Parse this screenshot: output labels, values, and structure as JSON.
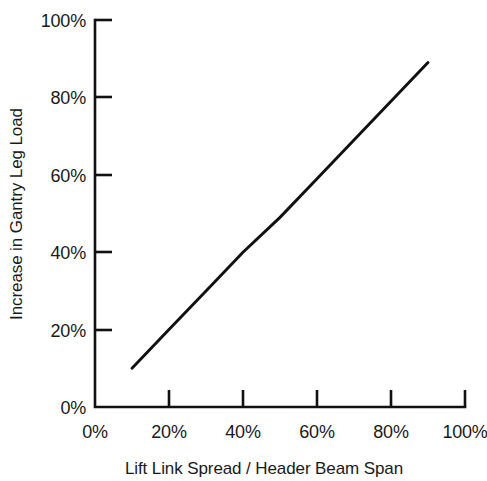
{
  "chart_data": {
    "type": "line",
    "title": "",
    "subtitle": "",
    "xlabel": "Lift Link Spread / Header Beam Span",
    "ylabel": "Increase in Gantry Leg Load",
    "xlim": [
      0,
      100
    ],
    "ylim": [
      0,
      100
    ],
    "grid": false,
    "legend": null,
    "legend_position": "none",
    "x_unit": "%",
    "y_unit": "%",
    "x_ticks": [
      0,
      20,
      40,
      60,
      80,
      100
    ],
    "y_ticks": [
      0,
      20,
      40,
      60,
      80,
      100
    ],
    "x_tick_labels": [
      "0%",
      "20%",
      "40%",
      "60%",
      "80%",
      "100%"
    ],
    "y_tick_labels": [
      "0%",
      "20%",
      "40%",
      "60%",
      "80%",
      "100%"
    ],
    "tick_direction": "in",
    "series": [
      {
        "name": "Increase in Gantry Leg Load",
        "color": "#111111",
        "x": [
          10,
          20,
          30,
          40,
          50,
          60,
          70,
          80,
          90
        ],
        "values": [
          10,
          20,
          30,
          40,
          49,
          59,
          69,
          79,
          89
        ]
      }
    ],
    "annotations": []
  },
  "axes": {
    "x_title": "Lift Link Spread / Header Beam Span",
    "y_title": "Increase in Gantry Leg Load"
  },
  "ticks": {
    "x": [
      {
        "label": "0%",
        "value": 0
      },
      {
        "label": "20%",
        "value": 20
      },
      {
        "label": "40%",
        "value": 40
      },
      {
        "label": "60%",
        "value": 60
      },
      {
        "label": "80%",
        "value": 80
      },
      {
        "label": "100%",
        "value": 100
      }
    ],
    "y": [
      {
        "label": "0%",
        "value": 0
      },
      {
        "label": "20%",
        "value": 20
      },
      {
        "label": "40%",
        "value": 40
      },
      {
        "label": "60%",
        "value": 60
      },
      {
        "label": "80%",
        "value": 80
      },
      {
        "label": "100%",
        "value": 100
      }
    ]
  },
  "colors": {
    "background": "#ffffff",
    "axis": "#111111",
    "line": "#111111",
    "text": "#1a1a1a"
  }
}
